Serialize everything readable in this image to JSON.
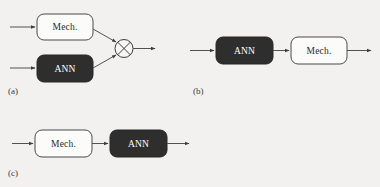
{
  "figure": {
    "background_color": "#f2f1ef",
    "line_color": "#52525a",
    "dark_block_fill": "#2e2e2e",
    "light_block_fill": "#fbfbfa"
  },
  "panels": [
    {
      "id": "a",
      "caption": "(a)",
      "topology": "parallel",
      "blocks": [
        {
          "label": "Mech.",
          "style": "light"
        },
        {
          "label": "ANN",
          "style": "dark"
        }
      ],
      "operator": {
        "symbol": "x-in-circle",
        "name": "multiply-node"
      }
    },
    {
      "id": "b",
      "caption": "(b)",
      "topology": "serial",
      "blocks": [
        {
          "label": "ANN",
          "style": "dark"
        },
        {
          "label": "Mech.",
          "style": "light"
        }
      ],
      "operator": null
    },
    {
      "id": "c",
      "caption": "(c)",
      "topology": "serial",
      "blocks": [
        {
          "label": "Mech.",
          "style": "light"
        },
        {
          "label": "ANN",
          "style": "dark"
        }
      ],
      "operator": null
    }
  ]
}
